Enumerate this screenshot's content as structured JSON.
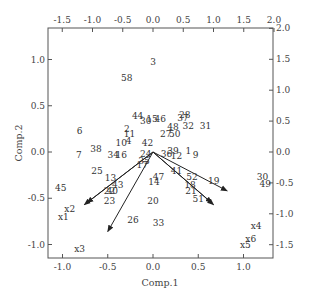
{
  "chart_data": {
    "type": "scatter",
    "subtype": "biplot",
    "title": "",
    "xlabel": "Comp.1",
    "ylabel": "Comp.2",
    "xlim": [
      -1.1,
      1.35
    ],
    "ylim": [
      -1.15,
      1.3
    ],
    "bottom_ticks": [
      "-1.0",
      "-0.5",
      "0.0",
      "0.5",
      "1.0"
    ],
    "left_ticks": [
      "1.0",
      "0.5",
      "0.0",
      "-0.5",
      "-1.0"
    ],
    "top_ticks": [
      "-1.5",
      "-1.0",
      "-0.5",
      "0.0",
      "0.5",
      "1.0",
      "1.5",
      "2.0"
    ],
    "right_ticks": [
      "2.0",
      "1.5",
      "1.0",
      "0.5",
      "0.0",
      "-0.5",
      "-1.0",
      "-1.5"
    ],
    "grid": false,
    "legend": "none",
    "points": [
      {
        "label": "3",
        "x": 0.0,
        "y": 0.97
      },
      {
        "label": "58",
        "x": -0.29,
        "y": 0.8
      },
      {
        "label": "28",
        "x": 0.35,
        "y": 0.4
      },
      {
        "label": "37",
        "x": 0.33,
        "y": 0.37
      },
      {
        "label": "44",
        "x": -0.17,
        "y": 0.39
      },
      {
        "label": "30",
        "x": -0.08,
        "y": 0.33
      },
      {
        "label": "15",
        "x": -0.01,
        "y": 0.36
      },
      {
        "label": "46",
        "x": 0.08,
        "y": 0.36
      },
      {
        "label": "48",
        "x": 0.22,
        "y": 0.27
      },
      {
        "label": "32",
        "x": 0.39,
        "y": 0.28
      },
      {
        "label": "31",
        "x": 0.58,
        "y": 0.28
      },
      {
        "label": "2",
        "x": -0.29,
        "y": 0.25
      },
      {
        "label": "11",
        "x": -0.26,
        "y": 0.19
      },
      {
        "label": "27",
        "x": 0.14,
        "y": 0.19
      },
      {
        "label": "50",
        "x": 0.24,
        "y": 0.19
      },
      {
        "label": "6",
        "x": -0.81,
        "y": 0.23
      },
      {
        "label": "10",
        "x": -0.35,
        "y": 0.1
      },
      {
        "label": "4",
        "x": -0.27,
        "y": 0.12
      },
      {
        "label": "42",
        "x": -0.06,
        "y": 0.1
      },
      {
        "label": "38",
        "x": -0.63,
        "y": 0.03
      },
      {
        "label": "7",
        "x": -0.82,
        "y": -0.03
      },
      {
        "label": "34",
        "x": -0.44,
        "y": -0.03
      },
      {
        "label": "16",
        "x": -0.35,
        "y": -0.03
      },
      {
        "label": "24",
        "x": -0.08,
        "y": -0.02
      },
      {
        "label": "1",
        "x": 0.39,
        "y": 0.01
      },
      {
        "label": "9",
        "x": 0.47,
        "y": -0.03
      },
      {
        "label": "39",
        "x": 0.22,
        "y": 0.01
      },
      {
        "label": "36",
        "x": 0.15,
        "y": -0.02
      },
      {
        "label": "12",
        "x": 0.26,
        "y": -0.04
      },
      {
        "label": "35",
        "x": -0.1,
        "y": -0.1
      },
      {
        "label": "17",
        "x": -0.12,
        "y": -0.14
      },
      {
        "label": "25",
        "x": -0.62,
        "y": -0.2
      },
      {
        "label": "41",
        "x": 0.26,
        "y": -0.21
      },
      {
        "label": "47",
        "x": 0.06,
        "y": -0.27
      },
      {
        "label": "14",
        "x": 0.01,
        "y": -0.32
      },
      {
        "label": "52",
        "x": 0.43,
        "y": -0.27
      },
      {
        "label": "19",
        "x": 0.67,
        "y": -0.31
      },
      {
        "label": "13",
        "x": -0.47,
        "y": -0.28
      },
      {
        "label": "43",
        "x": -0.39,
        "y": -0.36
      },
      {
        "label": "45",
        "x": -1.02,
        "y": -0.39
      },
      {
        "label": "18",
        "x": 0.41,
        "y": -0.36
      },
      {
        "label": "22",
        "x": -0.48,
        "y": -0.42
      },
      {
        "label": "40",
        "x": -0.45,
        "y": -0.42
      },
      {
        "label": "21",
        "x": 0.42,
        "y": -0.42
      },
      {
        "label": "23",
        "x": -0.48,
        "y": -0.53
      },
      {
        "label": "20",
        "x": 0.0,
        "y": -0.53
      },
      {
        "label": "51",
        "x": 0.5,
        "y": -0.51
      },
      {
        "label": "30b",
        "x": 1.21,
        "y": -0.27
      },
      {
        "label": "49",
        "x": 1.24,
        "y": -0.35
      },
      {
        "label": "26",
        "x": -0.22,
        "y": -0.73
      },
      {
        "label": "33",
        "x": 0.06,
        "y": -0.77
      }
    ],
    "loadings": [
      {
        "label": "x1",
        "x": -0.76,
        "y": -0.57,
        "label_x": -0.99,
        "label_y": -0.7
      },
      {
        "label": "x2",
        "x": -0.73,
        "y": -0.55,
        "label_x": -0.92,
        "label_y": -0.62
      },
      {
        "label": "x3",
        "x": -0.5,
        "y": -0.86,
        "label_x": -0.81,
        "label_y": -1.05
      },
      {
        "label": "x4",
        "x": 0.82,
        "y": -0.42,
        "label_x": 1.14,
        "label_y": -0.8
      },
      {
        "label": "x5",
        "x": 0.65,
        "y": -0.55,
        "label_x": 1.02,
        "label_y": -1.0
      },
      {
        "label": "x6",
        "x": 0.67,
        "y": -0.57,
        "label_x": 1.08,
        "label_y": -0.94
      }
    ]
  }
}
